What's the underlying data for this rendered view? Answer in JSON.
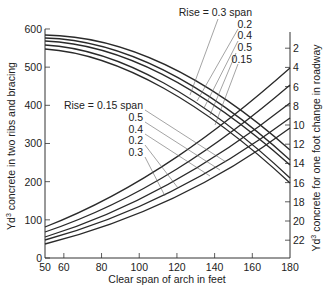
{
  "chart_data": {
    "type": "line",
    "title": "",
    "xlabel": "Clear span of arch in feet",
    "ylabel_left": "Yd³ concrete in two ribs and bracing",
    "ylabel_right": "Yd³ concrete for one foot change in roadway",
    "xlim": [
      50,
      180
    ],
    "ylim_left": [
      0,
      600
    ],
    "ylim_right_inverted": [
      0,
      24
    ],
    "x_ticks": [
      50,
      60,
      80,
      100,
      120,
      140,
      160,
      180
    ],
    "y_ticks_left": [
      0,
      100,
      200,
      300,
      400,
      500,
      600
    ],
    "y_ticks_right": [
      2,
      4,
      6,
      8,
      10,
      12,
      14,
      16,
      18,
      20,
      22
    ],
    "grid": false,
    "series_left_axis": {
      "description": "Yd3 concrete in two ribs and bracing (descending curves)",
      "x": [
        50,
        80,
        120,
        150,
        180
      ],
      "series": [
        {
          "name": "Rise = 0.3 span",
          "values": [
            582,
            570,
            510,
            420,
            283
          ]
        },
        {
          "name": "Rise = 0.2 span",
          "values": [
            574,
            560,
            495,
            400,
            257
          ]
        },
        {
          "name": "Rise = 0.4 span",
          "values": [
            566,
            548,
            478,
            385,
            244
          ]
        },
        {
          "name": "Rise = 0.5 span",
          "values": [
            556,
            535,
            460,
            360,
            210
          ]
        },
        {
          "name": "Rise = 0.15 span",
          "values": [
            546,
            522,
            445,
            345,
            197
          ]
        }
      ]
    },
    "series_right_axis": {
      "description": "Yd3 concrete for one foot change in roadway (rising curves, right axis inverted)",
      "x": [
        50,
        180
      ],
      "series": [
        {
          "name": "Rise = 0.15 span",
          "values_left_units_at_50": 81,
          "right_value_at_180": 4.1
        },
        {
          "name": "Rise = 0.5 span",
          "values_left_units_at_50": 68,
          "right_value_at_180": 5.8
        },
        {
          "name": "Rise = 0.4 span",
          "values_left_units_at_50": 55,
          "right_value_at_180": 7.7
        },
        {
          "name": "Rise = 0.2 span",
          "values_left_units_at_50": 47,
          "right_value_at_180": 9.3
        },
        {
          "name": "Rise = 0.3 span",
          "values_left_units_at_50": 37,
          "right_value_at_180": 10.3
        }
      ]
    },
    "annotations_upper": [
      "Rise = 0.3 span",
      "0.2",
      "0.4",
      "0.5",
      "0.15"
    ],
    "annotations_lower": [
      "Rise = 0.15 span",
      "0.5",
      "0.4",
      "0.2",
      "0.3"
    ]
  },
  "labels": {
    "xlabel": "Clear span of arch in feet",
    "ylabel_left_prefix": "Yd",
    "ylabel_left_sup": "3",
    "ylabel_left_rest": " concrete in two ribs and bracing",
    "ylabel_right_prefix": "Yd",
    "ylabel_right_sup": "3",
    "ylabel_right_rest": " concrete for one foot change in roadway",
    "upper_annotations": [
      {
        "text": "Rise = 0.3 span",
        "x": 252,
        "y": 16
      },
      {
        "text": "0.2",
        "x": 252,
        "y": 28
      },
      {
        "text": "0.4",
        "x": 252,
        "y": 39
      },
      {
        "text": "0.5",
        "x": 252,
        "y": 51
      },
      {
        "text": "0.15",
        "x": 252,
        "y": 63
      }
    ],
    "lower_annotations": [
      {
        "text": "Rise = 0.15 span",
        "x": 143,
        "y": 109
      },
      {
        "text": "0.5",
        "x": 143,
        "y": 121
      },
      {
        "text": "0.4",
        "x": 143,
        "y": 133
      },
      {
        "text": "0.2",
        "x": 143,
        "y": 144
      },
      {
        "text": "0.3",
        "x": 143,
        "y": 156
      }
    ]
  },
  "geometry": {
    "plot_left": 45,
    "plot_right": 290,
    "plot_bottom": 258,
    "plot_top_right_axis": 32,
    "descending_paths": [
      "M45,35 C120,36 200,70 290,150",
      "M45,38 C120,40 200,78 290,160",
      "M45,41 C120,44 200,85 290,165",
      "M45,45 C120,49 205,98 290,178",
      "M45,49 C120,54 205,104 290,183"
    ],
    "rising_paths": [
      "M45,227 C140,190 220,130 290,68",
      "M45,232 C140,200 220,145 290,85",
      "M45,237 C140,208 220,158 290,103",
      "M45,240 C140,214 220,170 290,118",
      "M45,244 C140,220 220,180 290,128"
    ],
    "upper_leaders": [
      [
        [
          218,
          19
        ],
        [
          190,
          95
        ]
      ],
      [
        [
          238,
          29
        ],
        [
          197,
          101
        ]
      ],
      [
        [
          238,
          41
        ],
        [
          204,
          108
        ]
      ],
      [
        [
          236,
          53
        ],
        [
          210,
          115
        ]
      ],
      [
        [
          238,
          64
        ],
        [
          215,
          125
        ]
      ]
    ],
    "lower_leaders": [
      [
        [
          145,
          110
        ],
        [
          226,
          162
        ]
      ],
      [
        [
          145,
          122
        ],
        [
          220,
          170
        ]
      ],
      [
        [
          145,
          134
        ],
        [
          210,
          176
        ]
      ],
      [
        [
          145,
          145
        ],
        [
          178,
          188
        ]
      ],
      [
        [
          145,
          157
        ],
        [
          165,
          196
        ]
      ]
    ]
  }
}
